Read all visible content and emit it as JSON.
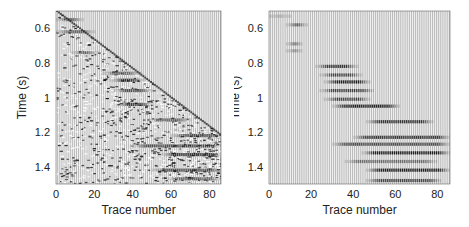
{
  "chart_data": [
    {
      "type": "heatmap",
      "subtype": "seismic-wiggle-gather",
      "title": "",
      "xlabel": "Trace number",
      "ylabel": "Time (s)",
      "xlim": [
        0,
        86
      ],
      "ylim": [
        1.5,
        0.5
      ],
      "x_ticks": [
        0,
        20,
        40,
        60,
        80
      ],
      "y_ticks": [
        0.6,
        0.8,
        1.0,
        1.2,
        1.4
      ],
      "y_tick_labels": [
        "0.6",
        "0.8",
        "1",
        "1.2",
        "1.4"
      ],
      "grid": false,
      "legend": null,
      "first_break": {
        "trace_start": 0,
        "time_start": 0.5,
        "trace_end": 86,
        "time_end": 1.22
      },
      "noisy_region": true,
      "events": [
        {
          "time": 0.55,
          "trace_from": 0,
          "trace_to": 14,
          "strength": 0.7
        },
        {
          "time": 0.62,
          "trace_from": 0,
          "trace_to": 20,
          "strength": 0.6
        },
        {
          "time": 0.74,
          "trace_from": 8,
          "trace_to": 22,
          "strength": 0.6
        },
        {
          "time": 0.86,
          "trace_from": 24,
          "trace_to": 44,
          "strength": 0.6
        },
        {
          "time": 0.9,
          "trace_from": 28,
          "trace_to": 46,
          "strength": 0.8
        },
        {
          "time": 0.96,
          "trace_from": 30,
          "trace_to": 50,
          "strength": 0.7
        },
        {
          "time": 1.04,
          "trace_from": 32,
          "trace_to": 50,
          "strength": 0.8
        },
        {
          "time": 1.13,
          "trace_from": 48,
          "trace_to": 70,
          "strength": 0.6
        },
        {
          "time": 1.22,
          "trace_from": 60,
          "trace_to": 86,
          "strength": 0.7
        },
        {
          "time": 1.28,
          "trace_from": 40,
          "trace_to": 86,
          "strength": 0.7
        },
        {
          "time": 1.33,
          "trace_from": 55,
          "trace_to": 86,
          "strength": 0.8
        },
        {
          "time": 1.42,
          "trace_from": 50,
          "trace_to": 86,
          "strength": 0.7
        },
        {
          "time": 1.47,
          "trace_from": 58,
          "trace_to": 86,
          "strength": 0.6
        }
      ]
    },
    {
      "type": "heatmap",
      "subtype": "seismic-wiggle-gather",
      "title": "",
      "xlabel": "Trace number",
      "ylabel": "Time (s)",
      "xlim": [
        0,
        86
      ],
      "ylim": [
        1.5,
        0.5
      ],
      "x_ticks": [
        0,
        20,
        40,
        60,
        80
      ],
      "y_ticks": [
        0.6,
        0.8,
        1.0,
        1.2,
        1.4
      ],
      "y_tick_labels": [
        "0.6",
        "0.8",
        "1",
        "1.2",
        "1.4"
      ],
      "grid": false,
      "legend": null,
      "first_break": null,
      "noisy_region": false,
      "events": [
        {
          "time": 0.53,
          "trace_from": 0,
          "trace_to": 10,
          "strength": 0.3
        },
        {
          "time": 0.58,
          "trace_from": 8,
          "trace_to": 18,
          "strength": 0.8
        },
        {
          "time": 0.69,
          "trace_from": 8,
          "trace_to": 16,
          "strength": 0.8
        },
        {
          "time": 0.73,
          "trace_from": 8,
          "trace_to": 16,
          "strength": 0.6
        },
        {
          "time": 0.82,
          "trace_from": 22,
          "trace_to": 42,
          "strength": 0.8
        },
        {
          "time": 0.87,
          "trace_from": 24,
          "trace_to": 44,
          "strength": 0.7
        },
        {
          "time": 0.91,
          "trace_from": 26,
          "trace_to": 48,
          "strength": 0.9
        },
        {
          "time": 0.96,
          "trace_from": 24,
          "trace_to": 50,
          "strength": 0.7
        },
        {
          "time": 1.01,
          "trace_from": 26,
          "trace_to": 48,
          "strength": 0.7
        },
        {
          "time": 1.05,
          "trace_from": 30,
          "trace_to": 62,
          "strength": 0.9
        },
        {
          "time": 1.14,
          "trace_from": 46,
          "trace_to": 78,
          "strength": 0.8
        },
        {
          "time": 1.23,
          "trace_from": 40,
          "trace_to": 86,
          "strength": 0.8
        },
        {
          "time": 1.27,
          "trace_from": 30,
          "trace_to": 86,
          "strength": 0.7
        },
        {
          "time": 1.32,
          "trace_from": 44,
          "trace_to": 86,
          "strength": 0.9
        },
        {
          "time": 1.37,
          "trace_from": 36,
          "trace_to": 80,
          "strength": 0.5
        },
        {
          "time": 1.42,
          "trace_from": 46,
          "trace_to": 86,
          "strength": 0.9
        },
        {
          "time": 1.48,
          "trace_from": 46,
          "trace_to": 82,
          "strength": 0.7
        }
      ]
    }
  ],
  "panels": [
    {
      "xlabel": "Trace number",
      "ylabel": "Time (s)"
    },
    {
      "xlabel": "Trace number",
      "ylabel": "Time (s)"
    }
  ]
}
